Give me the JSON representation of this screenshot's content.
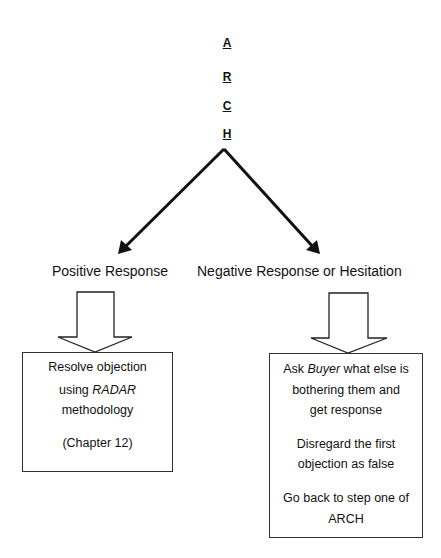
{
  "acronym": {
    "letters": [
      "A",
      "R",
      "C",
      "H"
    ]
  },
  "branches": {
    "positive": {
      "label": "Positive Response",
      "box": {
        "line1": "Resolve objection",
        "line2_pre": "using ",
        "line2_em": "RADAR",
        "line3": "methodology",
        "line4": "(Chapter 12)"
      }
    },
    "negative": {
      "label": "Negative Response or Hesitation",
      "box": {
        "line1_pre": "Ask ",
        "line1_em": "Buyer",
        "line1_post": " what else is",
        "line2": "bothering them and",
        "line3": "get response",
        "line4": "Disregard the first",
        "line5": "objection as false",
        "line6": "Go back to step one of",
        "line7": "ARCH"
      }
    }
  },
  "colors": {
    "stroke": "#111111",
    "background": "#ffffff"
  }
}
